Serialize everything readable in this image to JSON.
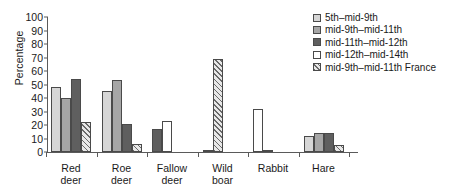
{
  "chart_data": {
    "type": "bar",
    "title": "",
    "xlabel": "",
    "ylabel": "Percentage",
    "ylim": [
      0,
      100
    ],
    "yticks": [
      0,
      10,
      20,
      30,
      40,
      50,
      60,
      70,
      80,
      90,
      100
    ],
    "grid": false,
    "legend_position": "right",
    "categories": [
      "Red\ndeer",
      "Roe\ndeer",
      "Fallow\ndeer",
      "Wild\nboar",
      "Rabbit",
      "Hare"
    ],
    "series": [
      {
        "name": "5th–mid-9th",
        "values": [
          48,
          45,
          0,
          0,
          0,
          12
        ]
      },
      {
        "name": "mid-9th–mid-11th",
        "values": [
          40,
          53,
          0,
          1,
          0,
          14
        ]
      },
      {
        "name": "mid-11th–mid-12th",
        "values": [
          54,
          21,
          17,
          0,
          0,
          14
        ]
      },
      {
        "name": "mid-12th–mid-14th",
        "values": [
          0,
          0,
          23,
          0,
          32,
          0
        ]
      },
      {
        "name": "mid-9th–mid-11th France",
        "values": [
          22,
          6,
          0,
          69,
          1,
          5
        ]
      }
    ],
    "colors": {
      "5th–mid-9th": "#d6d6d6",
      "mid-9th–mid-11th": "#a6a6a6",
      "mid-11th–mid-12th": "#5f5f5f",
      "mid-12th–mid-14th": "#ffffff",
      "mid-9th–mid-11th France": "#hatch"
    },
    "axis_color": "#5a5a5a",
    "background": "#ffffff"
  }
}
